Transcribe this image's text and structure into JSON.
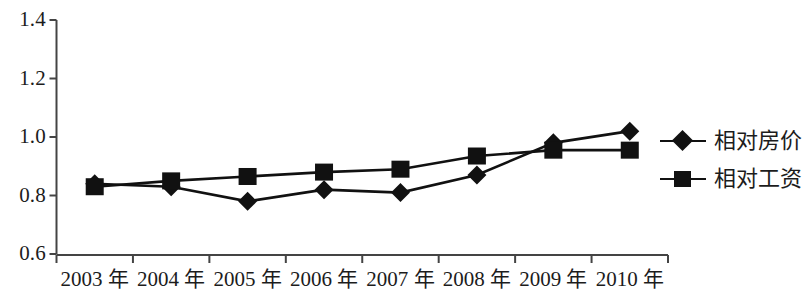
{
  "chart_data": {
    "type": "line",
    "title": "",
    "subtitle": "",
    "xlabel": "",
    "ylabel": "",
    "categories": [
      "2003 年",
      "2004 年",
      "2005 年",
      "2006 年",
      "2007 年",
      "2008 年",
      "2009 年",
      "2010 年"
    ],
    "ylim": [
      0.6,
      1.4
    ],
    "y_ticks": [
      "0.6",
      "0.8",
      "1.0",
      "1.2",
      "1.4"
    ],
    "y_tick_values": [
      0.6,
      0.8,
      1.0,
      1.2,
      1.4
    ],
    "grid": false,
    "legend_position": "right",
    "series": [
      {
        "name": "相对房价",
        "marker": "diamond",
        "color": "#111111",
        "values": [
          0.84,
          0.83,
          0.78,
          0.82,
          0.81,
          0.87,
          0.98,
          1.02
        ]
      },
      {
        "name": "相对工资",
        "marker": "square",
        "color": "#111111",
        "values": [
          0.83,
          0.85,
          0.865,
          0.88,
          0.89,
          0.935,
          0.955,
          0.955
        ]
      }
    ]
  },
  "axis": {
    "y_tick_labels": [
      "1.4",
      "1.2",
      "1.0",
      "0.8",
      "0.6"
    ],
    "x_tick_labels": [
      "2003 年",
      "2004 年",
      "2005 年",
      "2006 年",
      "2007 年",
      "2008 年",
      "2009 年",
      "2010 年"
    ]
  },
  "legend": {
    "items": [
      {
        "label": "相对房价",
        "marker": "diamond"
      },
      {
        "label": "相对工资",
        "marker": "square"
      }
    ]
  }
}
